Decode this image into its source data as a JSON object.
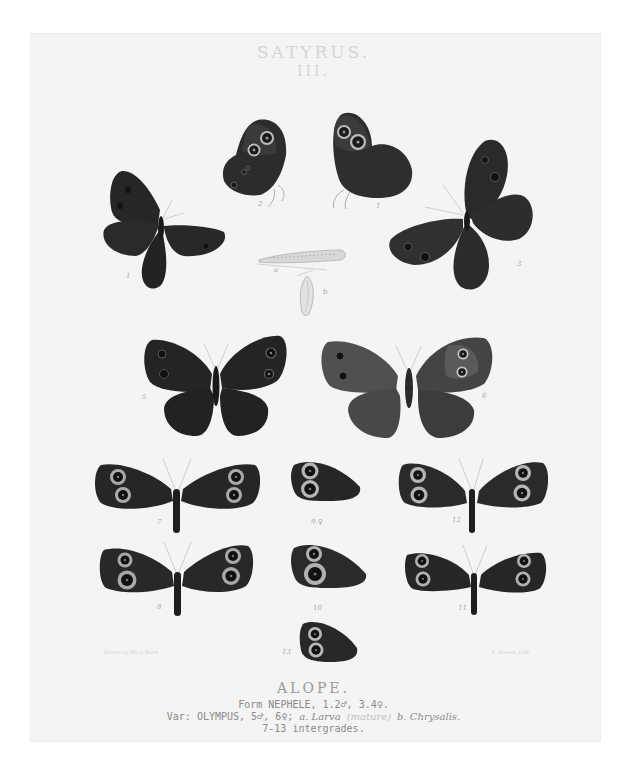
{
  "plate": {
    "genus": "SATYRUS.",
    "plate_number": "III."
  },
  "caption": {
    "species": "ALOPE.",
    "form_line": "Form NEPHELE, 1.2♂, 3.4♀.",
    "var_prefix": "Var: OLYMPUS, 5♂, 6♀;",
    "larva": "a. Larva",
    "larva_note": "(mature)",
    "chrysalis": "b. Chrysalis.",
    "intergrades": "7-13 intergrades."
  },
  "credits": {
    "artist": "Drawn by Mary Peart",
    "lithographer": "L. Bowen, Lith."
  },
  "colors": {
    "sheet": "#f4f4f4",
    "wing_dark": "#262626",
    "wing_mid": "#3a3a3a",
    "wing_pale": "#5e5e5e",
    "ring": "#b8b8b8",
    "title": "#d4d4d4"
  },
  "figures": [
    {
      "id": "1",
      "label": "1",
      "view": "upperside male",
      "x": 100,
      "y": 168
    },
    {
      "id": "2",
      "label": "2",
      "view": "underside male (left)",
      "x": 220,
      "y": 115
    },
    {
      "id": "2b",
      "label": "1",
      "view": "underside (right)",
      "x": 328,
      "y": 110
    },
    {
      "id": "3",
      "label": "3",
      "view": "upperside female",
      "x": 385,
      "y": 135
    },
    {
      "id": "a",
      "label": "a",
      "view": "larva",
      "x": 257,
      "y": 246
    },
    {
      "id": "b",
      "label": "b",
      "view": "chrysalis",
      "x": 295,
      "y": 275
    },
    {
      "id": "5",
      "label": "5",
      "view": "upperside male OLYMPUS",
      "x": 140,
      "y": 332
    },
    {
      "id": "6",
      "label": "6",
      "view": "upperside female OLYMPUS",
      "x": 318,
      "y": 332
    },
    {
      "id": "7",
      "label": "7",
      "x": 93,
      "y": 455
    },
    {
      "id": "9",
      "label": "9",
      "x": 290,
      "y": 457
    },
    {
      "id": "12",
      "label": "12",
      "x": 397,
      "y": 455
    },
    {
      "id": "8",
      "label": "8",
      "x": 98,
      "y": 538
    },
    {
      "id": "10",
      "label": "10",
      "x": 290,
      "y": 540
    },
    {
      "id": "11",
      "label": "11",
      "x": 403,
      "y": 545
    },
    {
      "id": "13",
      "label": "13",
      "x": 297,
      "y": 618
    }
  ]
}
